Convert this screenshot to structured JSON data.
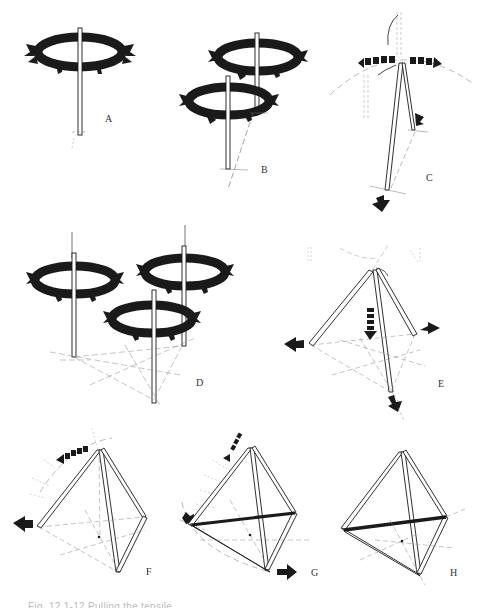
{
  "figure": {
    "caption": "Fig. 12.1-12 Pulling the tensile...",
    "panels": [
      {
        "id": "A",
        "label": "A",
        "description": "Single vertical strut with ring of outward force arrows"
      },
      {
        "id": "B",
        "label": "B",
        "description": "Two vertical struts with rings of outward force arrows, base points joined by dashed line"
      },
      {
        "id": "C",
        "label": "C",
        "description": "Two struts leaning together meeting at apex, dashed arc with rotation arrows and downward thrust arrows"
      },
      {
        "id": "D",
        "label": "D",
        "description": "Three vertical struts with rings of outward force arrows and triangulated dashed ground lines"
      },
      {
        "id": "E",
        "label": "E",
        "description": "Tripod of three struts meeting at apex with dashed downward arrow and outward base arrows"
      },
      {
        "id": "F",
        "label": "F",
        "description": "Tetrahedron-like frame with curved arrow along dashed arc and outward arrow at left"
      },
      {
        "id": "G",
        "label": "G",
        "description": "Tetrahedron frame with thick tension member across middle, arrows at left and bottom"
      },
      {
        "id": "H",
        "label": "H",
        "description": "Completed tetrahedron frame with thick horizontal tension member"
      }
    ]
  },
  "colors": {
    "ink": "#1a1a1a",
    "faint": "#9a9a9a",
    "background": "#ffffff"
  }
}
